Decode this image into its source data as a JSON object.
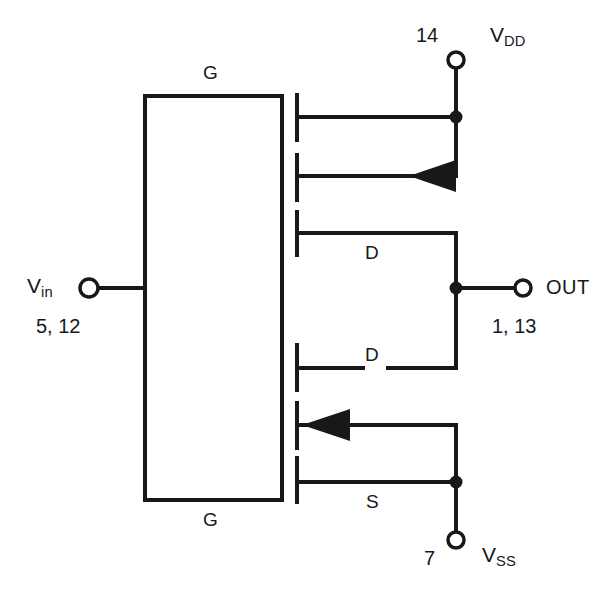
{
  "diagram": {
    "stroke_color": "#16181a",
    "background_color": "#ffffff"
  },
  "labels": {
    "gate_top": "G",
    "gate_bottom": "G",
    "drain_top": "D",
    "drain_bottom": "D",
    "source_bottom": "S",
    "vdd_name": "V",
    "vdd_sub": "DD",
    "vss_name": "V",
    "vss_sub": "SS",
    "vin_name": "V",
    "vin_sub": "in",
    "out_name": "OUT"
  },
  "pins": {
    "vdd": "14",
    "vss": "7",
    "vin": "5, 12",
    "out": "1, 13"
  },
  "terminals": [
    {
      "name": "vdd-terminal",
      "x": 456,
      "y": 60,
      "label": "VDD",
      "pin": "14"
    },
    {
      "name": "vss-terminal",
      "x": 456,
      "y": 540,
      "label": "VSS",
      "pin": "7"
    },
    {
      "name": "vin-terminal",
      "x": 88,
      "y": 288,
      "label": "Vin",
      "pin": "5, 12"
    },
    {
      "name": "out-terminal",
      "x": 523,
      "y": 288,
      "label": "OUT",
      "pin": "1, 13"
    }
  ],
  "junction_dots": [
    {
      "name": "vdd-junction",
      "x": 456,
      "y": 115
    },
    {
      "name": "out-junction",
      "x": 456,
      "y": 288
    },
    {
      "name": "vss-junction",
      "x": 456,
      "y": 482
    }
  ]
}
